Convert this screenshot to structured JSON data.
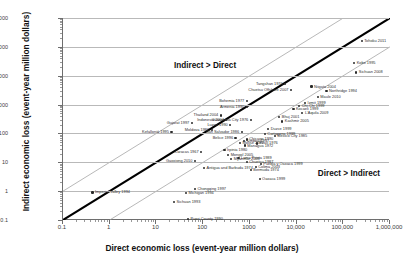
{
  "chart_data": {
    "type": "scatter",
    "title": "",
    "xlabel": "Direct economic loss (event-year million dollars)",
    "ylabel": "Indirect economic loss (event-year million dollars)",
    "xscale": "log",
    "yscale": "log",
    "xlim": [
      0.1,
      1000000
    ],
    "ylim": [
      0.1,
      1000000
    ],
    "grid": "horizontal",
    "legend": "none",
    "xticks": [
      "0.1",
      "1",
      "10",
      "100",
      "1000",
      "10,000",
      "100,000",
      "1,000,000"
    ],
    "yticks": [
      "0.1",
      "1",
      "10",
      "100",
      "1000",
      "10,000",
      "100,000",
      "1,000,000"
    ],
    "annotations": [
      {
        "text": "Indirect > Direct",
        "x": 25,
        "y": 22000
      },
      {
        "text": "Direct > Indirect",
        "x": 30000,
        "y": 4
      }
    ],
    "reference_lines": [
      {
        "name": "one-to-one",
        "slope": 1,
        "ratio": 1,
        "style": "thick-black"
      },
      {
        "name": "ten-times-indirect",
        "slope": 1,
        "ratio": 10,
        "style": "thin-gray"
      },
      {
        "name": "ten-times-direct",
        "slope": 1,
        "ratio": 0.1,
        "style": "thin-gray"
      }
    ],
    "points": [
      {
        "label": "Tohoku 2011",
        "x": 260000,
        "y": 160000,
        "side": "rgt"
      },
      {
        "label": "Kobe 1995",
        "x": 180000,
        "y": 28000,
        "side": "rgt"
      },
      {
        "label": "Sichuan 2008",
        "x": 200000,
        "y": 13000,
        "side": "rgt"
      },
      {
        "label": "Niigata 2004",
        "x": 22000,
        "y": 4200,
        "side": "rgt"
      },
      {
        "label": "Northridge 1994",
        "x": 46000,
        "y": 3000,
        "side": "rgt"
      },
      {
        "label": "Tangshan 1976",
        "x": 6000,
        "y": 5000,
        "side": "lft"
      },
      {
        "label": "Chuetsu Offshore 2007",
        "x": 8000,
        "y": 3200,
        "side": "lft"
      },
      {
        "label": "Maule 2010",
        "x": 30000,
        "y": 1800,
        "side": "rgt"
      },
      {
        "label": "Bohemia 1977",
        "x": 900,
        "y": 1300,
        "side": "lft"
      },
      {
        "label": "Armenia 1990",
        "x": 900,
        "y": 800,
        "side": "lft"
      },
      {
        "label": "Chi-Chi 1999",
        "x": 12000,
        "y": 900,
        "side": "rgt"
      },
      {
        "label": "Izmit 1999",
        "x": 16000,
        "y": 1100,
        "side": "rgt"
      },
      {
        "label": "L'Aquila 2009",
        "x": 14000,
        "y": 520,
        "side": "rgt"
      },
      {
        "label": "Kocaeli 1999",
        "x": 9000,
        "y": 700,
        "side": "rgt"
      },
      {
        "label": "Thailand 2004",
        "x": 250,
        "y": 420,
        "side": "lft"
      },
      {
        "label": "Indonesia 2004",
        "x": 330,
        "y": 300,
        "side": "lft"
      },
      {
        "label": "Guatemala City 1976",
        "x": 1100,
        "y": 300,
        "side": "lft"
      },
      {
        "label": "Bhuj 2001",
        "x": 4500,
        "y": 380,
        "side": "rgt"
      },
      {
        "label": "Kashmir 2005",
        "x": 5200,
        "y": 260,
        "side": "rgt"
      },
      {
        "label": "Gujarat 1997",
        "x": 60,
        "y": 230,
        "side": "lft"
      },
      {
        "label": "Luzon 1990",
        "x": 400,
        "y": 200,
        "side": "lft"
      },
      {
        "label": "Moldova 1986",
        "x": 160,
        "y": 130,
        "side": "lft"
      },
      {
        "label": "San Salvador 1986",
        "x": 700,
        "y": 110,
        "side": "lft"
      },
      {
        "label": "Duzce 1999",
        "x": 2600,
        "y": 140,
        "side": "rgt"
      },
      {
        "label": "Cartagena 1999",
        "x": 2200,
        "y": 95,
        "side": "rgt"
      },
      {
        "label": "Mexico City 1985",
        "x": 3600,
        "y": 80,
        "side": "rgt"
      },
      {
        "label": "Belice 1996",
        "x": 520,
        "y": 70,
        "side": "lft"
      },
      {
        "label": "Chicago 1990",
        "x": 900,
        "y": 62,
        "side": "rgt"
      },
      {
        "label": "Kefalloniá 1995",
        "x": 22,
        "y": 110,
        "side": "lft"
      },
      {
        "label": "Umbria 1997",
        "x": 800,
        "y": 55,
        "side": "rgt"
      },
      {
        "label": "Molise 2002",
        "x": 650,
        "y": 48,
        "side": "rgt"
      },
      {
        "label": "Friuli 1976",
        "x": 1500,
        "y": 45,
        "side": "rgt"
      },
      {
        "label": "Managua 1972",
        "x": 820,
        "y": 38,
        "side": "rgt"
      },
      {
        "label": "Caracas 1967",
        "x": 95,
        "y": 22,
        "side": "lft"
      },
      {
        "label": "Irpinia 1980",
        "x": 300,
        "y": 26,
        "side": "rgt"
      },
      {
        "label": "Mongol 2005",
        "x": 360,
        "y": 18,
        "side": "rgt"
      },
      {
        "label": "Myanmar 2008",
        "x": 420,
        "y": 13,
        "side": "rgt"
      },
      {
        "label": "Gaoxiong 2010",
        "x": 70,
        "y": 11,
        "side": "lft"
      },
      {
        "label": "Loma Prieta 1989",
        "x": 600,
        "y": 14,
        "side": "rgt"
      },
      {
        "label": "Chuetsu 1987",
        "x": 900,
        "y": 10,
        "side": "rgt"
      },
      {
        "label": "Puebla y Oaxaca 1999",
        "x": 1800,
        "y": 9,
        "side": "rgt"
      },
      {
        "label": "Colima 2003",
        "x": 1400,
        "y": 7,
        "side": "rgt"
      },
      {
        "label": "Bermuda 1974",
        "x": 1100,
        "y": 5.5,
        "side": "rgt"
      },
      {
        "label": "Antigua and Barbuda 1974",
        "x": 110,
        "y": 6.5,
        "side": "rgt"
      },
      {
        "label": "Chongqing 1997",
        "x": 70,
        "y": 1.2,
        "side": "rgt"
      },
      {
        "label": "Michigan 1994",
        "x": 45,
        "y": 0.85,
        "side": "rgt"
      },
      {
        "label": "Imperial Valley 1994",
        "x": 0.45,
        "y": 0.9,
        "side": "rgt"
      },
      {
        "label": "Sichuan 1993",
        "x": 25,
        "y": 0.42,
        "side": "rgt"
      },
      {
        "label": "Oaxaca 1999",
        "x": 1700,
        "y": 2.6,
        "side": "rgt"
      },
      {
        "label": "Pueri County 1990",
        "x": 50,
        "y": 0.105,
        "side": "rgt"
      }
    ]
  },
  "colors": {
    "axis": "#6e6e6e",
    "gridline": "#b9b9b9",
    "point": "#2b2b2b",
    "label_text": "#2e2e2e",
    "one_to_one_line": "#000000",
    "offset_line": "#9a9a9a",
    "background": "#ffffff"
  }
}
